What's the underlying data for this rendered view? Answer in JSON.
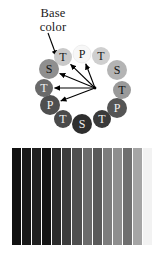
{
  "figure": {
    "caption": "Base\ncolor",
    "caption_lines": [
      "Base",
      "color"
    ]
  },
  "diagram": {
    "type": "radial-arrow-ring",
    "hub": {
      "x": 95,
      "y": 88
    },
    "pointer_arrow": {
      "name": "base-color-pointer",
      "from": {
        "x": 50,
        "y": 36
      },
      "to": {
        "x": 56,
        "y": 57
      }
    },
    "nodes": [
      {
        "id": "n1",
        "label": "T",
        "x": 63,
        "y": 57,
        "r": 9,
        "fill": "#c9c9c9",
        "text": "#1a1a1a"
      },
      {
        "id": "n2",
        "label": "P",
        "x": 82,
        "y": 54,
        "r": 9,
        "fill": "#f7f7f7",
        "text": "#141414"
      },
      {
        "id": "n3",
        "label": "T",
        "x": 101,
        "y": 56,
        "r": 9,
        "fill": "#cfcfcf",
        "text": "#1a1a1a"
      },
      {
        "id": "n4",
        "label": "S",
        "x": 117,
        "y": 70,
        "r": 10,
        "fill": "#b4b4b4",
        "text": "#141414"
      },
      {
        "id": "n5",
        "label": "T",
        "x": 122,
        "y": 90,
        "r": 9,
        "fill": "#9a9a9a",
        "text": "#101010"
      },
      {
        "id": "n6",
        "label": "P",
        "x": 117,
        "y": 108,
        "r": 10,
        "fill": "#555555",
        "text": "#f2f2f2"
      },
      {
        "id": "n7",
        "label": "T",
        "x": 102,
        "y": 119,
        "r": 9,
        "fill": "#3a3a3a",
        "text": "#f0f0f0"
      },
      {
        "id": "n8",
        "label": "S",
        "x": 82,
        "y": 124,
        "r": 10,
        "fill": "#2e2e2e",
        "text": "#ededed"
      },
      {
        "id": "n9",
        "label": "T",
        "x": 63,
        "y": 119,
        "r": 9,
        "fill": "#4a4a4a",
        "text": "#f0f0f0"
      },
      {
        "id": "n10",
        "label": "P",
        "x": 50,
        "y": 105,
        "r": 10,
        "fill": "#4f4f4f",
        "text": "#f2f2f2"
      },
      {
        "id": "n11",
        "label": "T",
        "x": 44,
        "y": 88,
        "r": 9,
        "fill": "#6a6a6a",
        "text": "#f2f2f2"
      },
      {
        "id": "n12",
        "label": "S",
        "x": 49,
        "y": 69,
        "r": 10,
        "fill": "#8f8f8f",
        "text": "#141414"
      }
    ],
    "arrows": [
      {
        "name": "arrow-to-node-T-upper-left",
        "to_node": "n1"
      },
      {
        "name": "arrow-to-node-P-top",
        "to_node": "n2"
      },
      {
        "name": "arrow-to-node-S-left",
        "to_node": "n12"
      },
      {
        "name": "arrow-to-node-T-left",
        "to_node": "n11"
      },
      {
        "name": "arrow-to-node-P-lower-left",
        "to_node": "n10"
      }
    ]
  },
  "gradient_strip": {
    "name": "grayscale-gradient-bars",
    "bar_count": 14,
    "bars": [
      "#111111",
      "#181818",
      "#202020",
      "#141414",
      "#2b2b2b",
      "#3c3c3c",
      "#4f4f4f",
      "#6b6b6b",
      "#5a5a5a",
      "#7d7d7d",
      "#8e8e8e",
      "#6f6f6f",
      "#a5a5a5",
      "#f2f2f2"
    ],
    "separator_color": "#ffffff"
  }
}
